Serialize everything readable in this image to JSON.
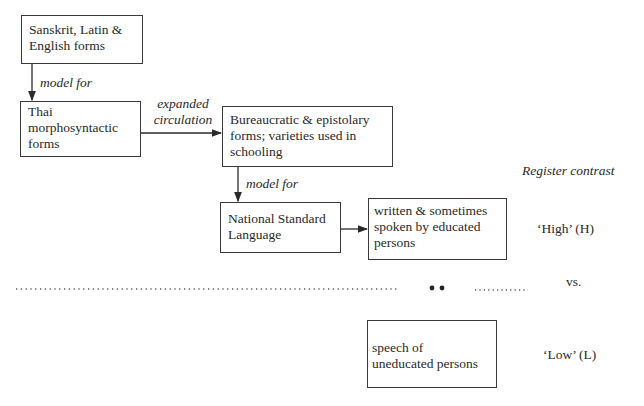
{
  "diagram": {
    "boxes": {
      "sources": {
        "lines": [
          "Sanskrit, Latin &",
          "English forms"
        ]
      },
      "thai": {
        "lines": [
          "Thai",
          "morphosyntactic",
          "forms"
        ]
      },
      "bureaucratic": {
        "lines": [
          "Bureaucratic & epistolary",
          "forms; varieties used in",
          "schooling"
        ]
      },
      "national": {
        "lines": [
          "National Standard",
          "Language"
        ]
      },
      "written": {
        "lines": [
          "written & sometimes",
          "spoken by educated",
          "persons"
        ]
      },
      "speech": {
        "lines": [
          "speech of",
          "uneducated persons"
        ]
      }
    },
    "edge_labels": {
      "model_for_1": "model for",
      "expanded": [
        "expanded",
        "circulation"
      ],
      "model_for_2": "model for"
    },
    "register": {
      "title": "Register contrast",
      "high": "‘High’ (H)",
      "vs": "vs.",
      "low": "‘Low’ (L)"
    },
    "colors": {
      "ink": "#2a2a2a",
      "stroke": "#3a3a3a",
      "background": "#ffffff"
    }
  }
}
